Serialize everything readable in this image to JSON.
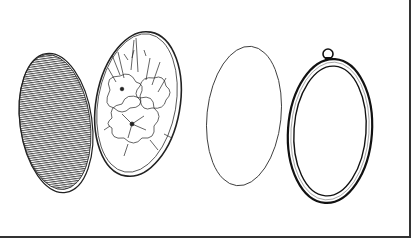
{
  "illustration": {
    "description": "Exploded view of an oval hanging embroidery frame",
    "parts": [
      {
        "name": "backing-board",
        "style": "hatched"
      },
      {
        "name": "embroidered-floral-panel",
        "style": "floral line art"
      },
      {
        "name": "clear-cover",
        "style": "outline"
      },
      {
        "name": "oval-frame-with-hanging-loop",
        "style": "double ring"
      }
    ],
    "colors": {
      "ink": "#1a1a1a",
      "background": "#ffffff"
    }
  }
}
